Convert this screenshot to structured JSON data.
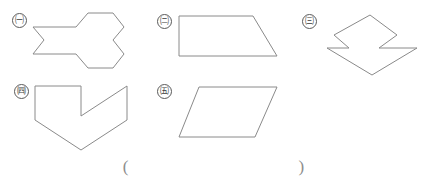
{
  "page": {
    "background_color": "#ffffff",
    "stroke_color": "#8a8a8a",
    "label_color": "#3a3a3a",
    "width": 427,
    "height": 183
  },
  "figures": [
    {
      "label": "ㄱ",
      "label_circled": "㈠",
      "name": "figure-a",
      "shape_description": "concave 12-sided polygon resembling two joined hexagons",
      "vertex_count": 12,
      "points": "5,17 48,17 60,3 85,3 96,17 85,30 96,44 85,58 60,58 48,44 5,44 16,30",
      "viewbox": "0 0 102 62",
      "svg_left": 28,
      "svg_top": 10,
      "svg_width": 102,
      "svg_height": 62,
      "label_left": 12,
      "label_top": 13
    },
    {
      "label": "ㄴ",
      "label_circled": "㈡",
      "name": "figure-b",
      "shape_description": "right trapezoid with vertical left side and slanted right side",
      "vertex_count": 4,
      "points": "2,2 76,2 100,42 2,42",
      "viewbox": "0 0 103 45",
      "svg_left": 177,
      "svg_top": 14,
      "svg_width": 103,
      "svg_height": 45,
      "label_left": 157,
      "label_top": 14
    },
    {
      "label": "ㄷ",
      "label_circled": "㈢",
      "name": "figure-c",
      "shape_description": "concave zigzag polygon, two offset arrow heads",
      "vertex_count": 8,
      "points": "48,2 75,22 57,35 95,35 50,62 5,35 27,35 12,22",
      "viewbox": "0 0 100 65",
      "svg_left": 322,
      "svg_top": 13,
      "svg_width": 100,
      "svg_height": 65,
      "label_left": 302,
      "label_top": 14
    },
    {
      "label": "ㄹ",
      "label_circled": "㈣",
      "name": "figure-d",
      "shape_description": "concave chevron / arrow-like hexagon pointing down",
      "vertex_count": 6,
      "points": "2,2 48,2 48,36 2,36",
      "polygon_points": "2,2 48,2 48,32 94,2 94,36 48,66 2,36",
      "viewbox": "0 0 98 70",
      "svg_left": 33,
      "svg_top": 84,
      "svg_width": 98,
      "svg_height": 70,
      "label_left": 14,
      "label_top": 84
    },
    {
      "label": "ㅁ",
      "label_circled": "㈤",
      "name": "figure-e",
      "shape_description": "parallelogram slanting right",
      "vertex_count": 4,
      "points": "22,2 100,2 78,52 2,52",
      "viewbox": "0 0 103 55",
      "svg_left": 177,
      "svg_top": 85,
      "svg_width": 103,
      "svg_height": 55,
      "label_left": 157,
      "label_top": 84
    }
  ],
  "answer": {
    "open_paren": "(",
    "close_paren": ")",
    "value": ""
  }
}
